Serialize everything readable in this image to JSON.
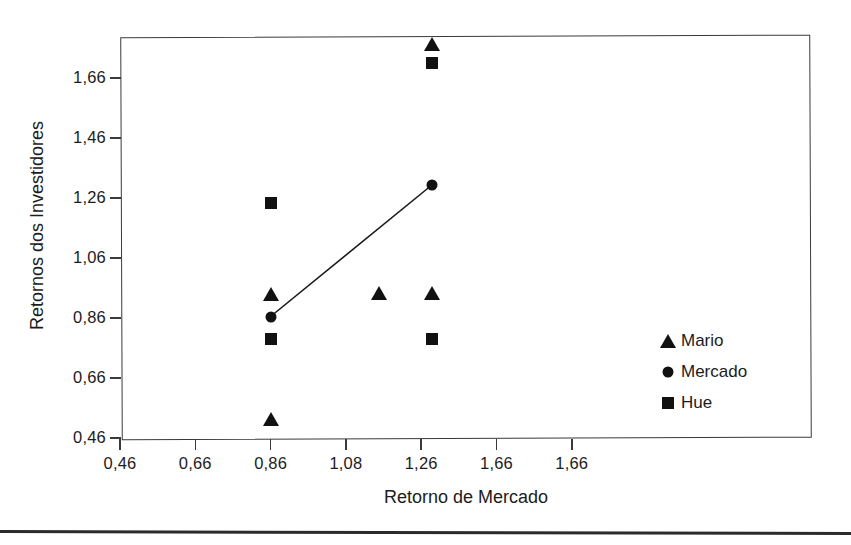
{
  "chart_data": {
    "type": "scatter",
    "title": "",
    "xlabel": "Retorno de Mercado",
    "ylabel": "Retornos dos Investidores",
    "xlim": [
      0.46,
      1.86
    ],
    "ylim": [
      0.46,
      1.86
    ],
    "grid": false,
    "legend_position": "right-inner",
    "x_ticks": [
      "0,46",
      "0,66",
      "0,86",
      "1,08",
      "1,26",
      "1,66",
      "1,66"
    ],
    "x_tick_values": [
      0.46,
      0.66,
      0.86,
      1.08,
      1.26,
      1.66,
      1.66
    ],
    "y_ticks": [
      "0,46",
      "0,66",
      "0,86",
      "1,06",
      "1,26",
      "1,46",
      "1,66"
    ],
    "y_tick_values": [
      0.46,
      0.66,
      0.86,
      1.06,
      1.26,
      1.46,
      1.66
    ],
    "series": [
      {
        "name": "Mario",
        "marker": "triangle",
        "color": "#111111",
        "points": [
          {
            "x": 0.86,
            "y": 0.525
          },
          {
            "x": 0.86,
            "y": 0.94
          },
          {
            "x": 1.16,
            "y": 0.945
          },
          {
            "x": 1.29,
            "y": 0.945
          },
          {
            "x": 1.29,
            "y": 1.775
          }
        ]
      },
      {
        "name": "Mercado",
        "marker": "circle",
        "color": "#111111",
        "points": [
          {
            "x": 0.86,
            "y": 0.865
          },
          {
            "x": 1.29,
            "y": 1.305
          }
        ]
      },
      {
        "name": "Hue",
        "marker": "square",
        "color": "#111111",
        "points": [
          {
            "x": 0.86,
            "y": 0.79
          },
          {
            "x": 0.86,
            "y": 1.245
          },
          {
            "x": 1.29,
            "y": 0.79
          },
          {
            "x": 1.29,
            "y": 1.71
          }
        ]
      }
    ],
    "trend_line": {
      "name": "Mercado",
      "from": {
        "x": 0.86,
        "y": 0.865
      },
      "to": {
        "x": 1.29,
        "y": 1.305
      },
      "color": "#1a1a1a"
    },
    "legend": [
      {
        "label": "Mario",
        "marker": "triangle"
      },
      {
        "label": "Mercado",
        "marker": "circle"
      },
      {
        "label": "Hue",
        "marker": "square"
      }
    ]
  }
}
